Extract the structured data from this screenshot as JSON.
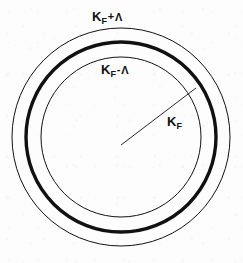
{
  "figure": {
    "name": "fermi-surface-shell-diagram",
    "background_color": "#fdfdfd",
    "stroke_color": "#111111",
    "center": {
      "x": 121,
      "y": 137
    },
    "circles": [
      {
        "id": "outer",
        "name": "outer-shell-circle",
        "radius": 109,
        "stroke_width": 1,
        "label_ref": "outer"
      },
      {
        "id": "fermi",
        "name": "fermi-surface-circle",
        "radius": 95,
        "stroke_width": 3.4,
        "label_ref": "radius"
      },
      {
        "id": "inner",
        "name": "inner-shell-circle",
        "radius": 80,
        "stroke_width": 1,
        "label_ref": "inner"
      }
    ],
    "radius_line": {
      "name": "fermi-radius-line",
      "x1": 121,
      "y1": 145,
      "x2": 196,
      "y2": 88,
      "stroke_width": 0.9
    },
    "labels": {
      "outer": {
        "text": "K_F + Λ",
        "base": "K",
        "subscript": "F",
        "operator": "+",
        "lambda": "Λ",
        "x": 92,
        "y": 8
      },
      "inner": {
        "text": "K_F - Λ",
        "base": "K",
        "subscript": "F",
        "operator": "-",
        "lambda": "Λ",
        "x": 101,
        "y": 61
      },
      "radius": {
        "text": "K_F",
        "base": "K",
        "subscript": "F",
        "operator": "",
        "lambda": "",
        "x": 167,
        "y": 113
      }
    }
  },
  "chart_data": {
    "type": "scatter",
    "xlabel": "",
    "ylabel": "",
    "annotations": [
      "K_F + Λ",
      "K_F - Λ",
      "K_F"
    ],
    "series": [
      {
        "name": "outer shell boundary",
        "radius": 109,
        "style": "thin"
      },
      {
        "name": "Fermi surface",
        "radius": 95,
        "style": "bold"
      },
      {
        "name": "inner shell boundary",
        "radius": 80,
        "style": "thin"
      }
    ],
    "center": [
      121,
      137
    ],
    "grid": false,
    "legend": "none"
  }
}
